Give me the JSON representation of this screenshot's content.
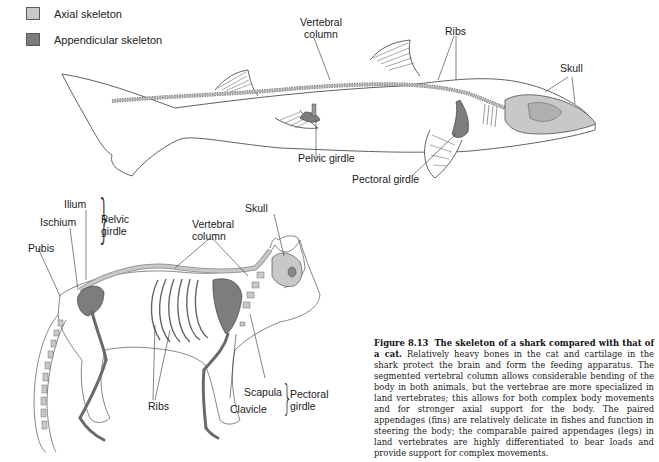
{
  "legend": {
    "items": [
      {
        "label": "Axial skeleton",
        "color": "#c8c8c8"
      },
      {
        "label": "Appendicular skeleton",
        "color": "#7d7d7d"
      }
    ]
  },
  "shark": {
    "labels": {
      "vertebral_column_1": "Vertebral",
      "vertebral_column_2": "column",
      "ribs": "Ribs",
      "skull": "Skull",
      "pelvic_girdle": "Pelvic girdle",
      "pectoral_girdle": "Pectoral girdle"
    }
  },
  "cat": {
    "labels": {
      "ilium": "Ilium",
      "ischium": "Ischium",
      "pubis": "Pubis",
      "pelvic_girdle_1": "Pelvic",
      "pelvic_girdle_2": "girdle",
      "vertebral_column_1": "Vertebral",
      "vertebral_column_2": "column",
      "skull": "Skull",
      "ribs": "Ribs",
      "scapula": "Scapula",
      "clavicle": "Clavicle",
      "pectoral_girdle_1": "Pectoral",
      "pectoral_girdle_2": "girdle"
    }
  },
  "caption": {
    "figure_number": "Figure 8.13",
    "title": "The skeleton of a shark compared with that of a cat.",
    "body": "Relatively heavy bones in the cat and cartilage in the shark protect the brain and form the feeding apparatus. The segmented vertebral column allows considerable bending of the body in both animals, but the vertebrae are more specialized in land vertebrates; this allows for both complex body movements and for stronger axial support for the body. The paired appendages (fins) are relatively delicate in fishes and function in steering the body; the comparable paired appendages (legs) in land vertebrates are highly differentiated to bear loads and provide support for complex movements."
  },
  "colors": {
    "axial": "#c8c8c8",
    "appendicular": "#7d7d7d",
    "outline": "#3a3a3a"
  }
}
